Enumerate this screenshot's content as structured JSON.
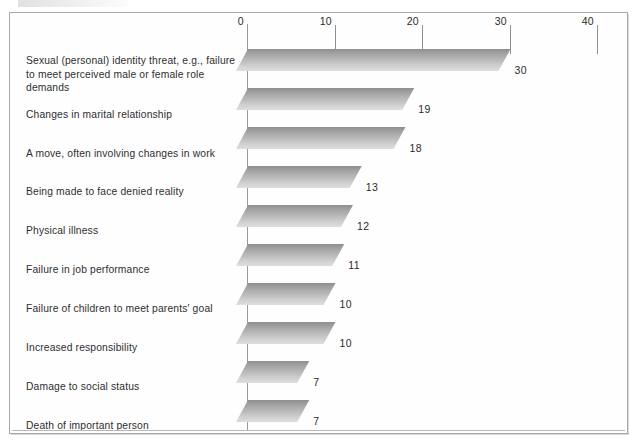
{
  "chart_data": {
    "type": "bar",
    "orientation": "horizontal",
    "title": "",
    "xlabel": "",
    "ylabel": "",
    "xlim": [
      0,
      40
    ],
    "xticks": [
      0,
      10,
      20,
      30,
      40
    ],
    "xtick_labels": [
      "0",
      "10",
      "20",
      "30",
      "40"
    ],
    "grid": false,
    "legend": null,
    "categories": [
      "Sexual (personal) identity threat, e.g., failure\nto meet perceived male or female role demands",
      "Changes in marital relationship",
      "A move, often involving changes in work",
      "Being made to face denied reality",
      "Physical illness",
      "Failure in job performance",
      "Failure of children to meet parents' goal",
      "Increased responsibility",
      "Damage to social status",
      "Death of important person"
    ],
    "values": [
      30,
      19,
      18,
      13,
      12,
      11,
      10,
      10,
      7,
      7
    ],
    "value_labels": [
      "30",
      "19",
      "18",
      "13",
      "12",
      "11",
      "10",
      "10",
      "7",
      "7"
    ],
    "colors": {
      "bar_dark": "#8e8e8e",
      "bar_light": "#dedede",
      "axis": "#9a9a9a",
      "text": "#2b2b2b",
      "frame": "#a8a8a8",
      "background": "#ffffff"
    }
  }
}
